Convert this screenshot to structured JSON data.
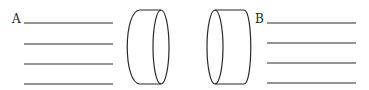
{
  "labels": {
    "a": "A",
    "b": "B"
  },
  "colors": {
    "stroke": "#2a2a2a",
    "background": "#ffffff"
  },
  "figure": {
    "left_lines": 4,
    "right_lines": 4,
    "cylinders": 2
  }
}
